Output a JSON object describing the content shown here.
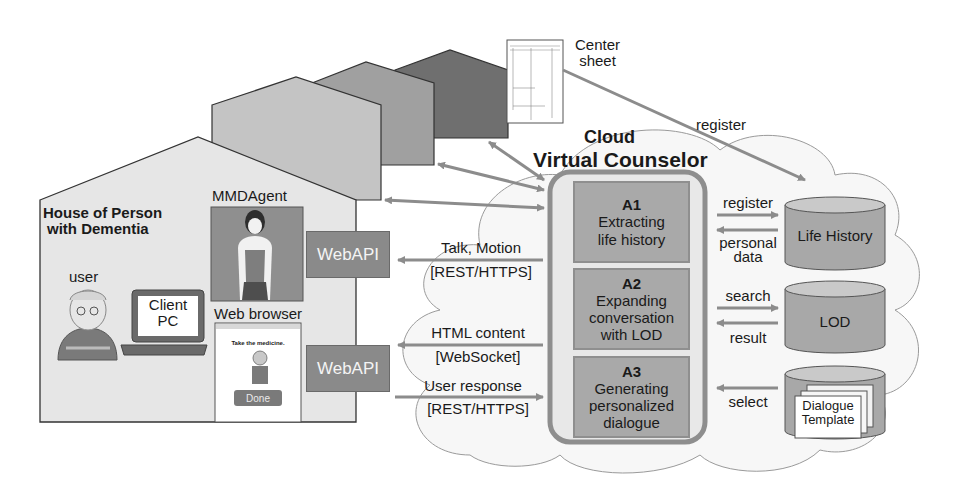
{
  "house": {
    "title_line1": "House of Person",
    "title_line2": "with Dementia",
    "user_label": "user",
    "client_pc_line1": "Client",
    "client_pc_line2": "PC",
    "mmdagent_label": "MMDAgent",
    "web_browser_label": "Web browser",
    "browser_prompt": "Take the medicine.",
    "browser_button": "Done",
    "webapi_top": "WebAPI",
    "webapi_bottom": "WebAPI"
  },
  "center_sheet": {
    "line1": "Center",
    "line2": "sheet",
    "register_label": "register"
  },
  "cloud": {
    "title_line1": "Cloud",
    "title_line2": "Virtual Counselor",
    "modules": [
      {
        "id": "A1",
        "line1": "Extracting",
        "line2": "life history",
        "line3": ""
      },
      {
        "id": "A2",
        "line1": "Expanding",
        "line2": "conversation",
        "line3": "with LOD"
      },
      {
        "id": "A3",
        "line1": "Generating",
        "line2": "personalized",
        "line3": "dialogue"
      }
    ]
  },
  "flows": {
    "talk_motion": "Talk, Motion",
    "talk_protocol": "[REST/HTTPS]",
    "html_content": "HTML content",
    "html_protocol": "[WebSocket]",
    "user_response": "User response",
    "user_protocol": "[REST/HTTPS]",
    "register": "register",
    "personal_data_line1": "personal",
    "personal_data_line2": "data",
    "search": "search",
    "result": "result",
    "select": "select"
  },
  "databases": {
    "life_history": "Life History",
    "lod": "LOD",
    "dialogue_line1": "Dialogue",
    "dialogue_line2": "Template"
  },
  "colors": {
    "house_main": "#e4e4e4",
    "house_2": "#c4c4c4",
    "house_3": "#a0a0a0",
    "house_4": "#6f6f6f",
    "arrow": "#8c8c8c",
    "module_fill": "#a9a9a9",
    "db_fill": "#a8a8a8"
  }
}
